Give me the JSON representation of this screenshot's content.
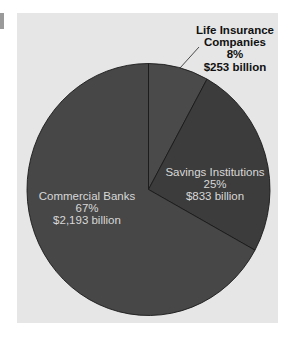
{
  "chart_data": {
    "type": "pie",
    "title": "",
    "categories": [
      "Life Insurance Companies",
      "Savings Institutions",
      "Commercial Banks"
    ],
    "values_percent": [
      8,
      25,
      67
    ],
    "values_billion_usd": [
      253,
      833,
      2193
    ],
    "slices": [
      {
        "name": "Life Insurance Companies",
        "percent": 8,
        "percent_label": "8%",
        "amount_label": "$253 billion",
        "color": "#4a4a4a",
        "label_style": "bold, outside with leader line"
      },
      {
        "name": "Savings Institutions",
        "percent": 25,
        "percent_label": "25%",
        "amount_label": "$833 billion",
        "color": "#3c3c3c",
        "label_style": "inside"
      },
      {
        "name": "Commercial Banks",
        "percent": 67,
        "percent_label": "67%",
        "amount_label": "$2,193 billion",
        "color": "#474747",
        "label_style": "inside"
      }
    ],
    "start_angle": "12 o'clock, clockwise",
    "legend": "none",
    "background": "#e6e6e6"
  },
  "labels": {
    "life": {
      "line1": "Life Insurance",
      "line2": "Companies",
      "pct": "8%",
      "amt": "$253 billion"
    },
    "savings": {
      "line1": "Savings Institutions",
      "pct": "25%",
      "amt": "$833 billion"
    },
    "commercial": {
      "line1": "Commercial Banks",
      "pct": "67%",
      "amt": "$2,193 billion"
    }
  }
}
